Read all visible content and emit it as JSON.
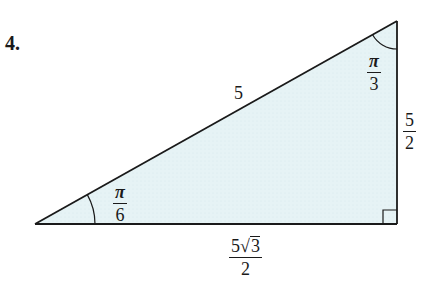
{
  "problem": {
    "number_label": "4."
  },
  "triangle": {
    "fill_color": "#e6f3f5",
    "stroke_color": "#1a1a1a",
    "vertices": {
      "left": [
        35,
        224
      ],
      "top_right": [
        397,
        21
      ],
      "bottom_right": [
        397,
        224
      ]
    },
    "hypotenuse_label": "5",
    "vertical_side": {
      "numerator": "5",
      "denominator": "2"
    },
    "horizontal_side": {
      "coefficient": "5",
      "radical_symbol": "√",
      "radicand": "3",
      "denominator": "2"
    },
    "angles": {
      "bottom_left": {
        "numerator": "π",
        "denominator": "6"
      },
      "top_right": {
        "numerator": "π",
        "denominator": "3"
      },
      "bottom_right": "right-angle"
    }
  }
}
